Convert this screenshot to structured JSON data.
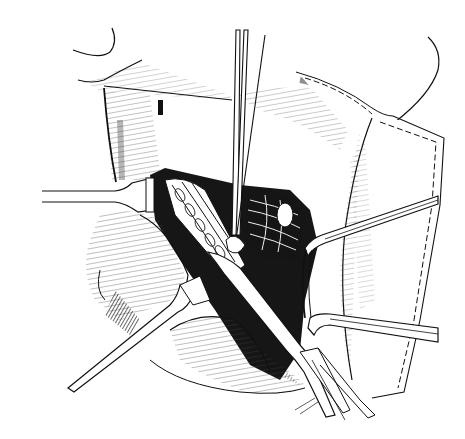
{
  "figure": {
    "type": "surgical-line-illustration",
    "background": "#ffffff",
    "ink": "#111111",
    "elements": [
      "skin-flap-upper",
      "skin-flap-right-with-dashed-suture",
      "retractor-left",
      "retractor-lower-left",
      "retractor-right-upper",
      "retractor-right-lower",
      "forceps-vertical",
      "forceps-diagonal",
      "muscle-bundle-central",
      "vessel-strands"
    ]
  }
}
